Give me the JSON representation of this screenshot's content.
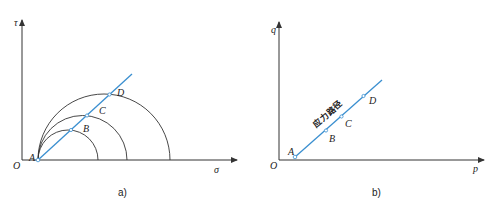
{
  "colors": {
    "axis": "#333333",
    "circle": "#333333",
    "stress_path": "#3a8fd0",
    "background": "#ffffff"
  },
  "panel_a": {
    "caption": "a)",
    "y_axis_label": "τ",
    "x_axis_label": "σ",
    "origin_label": "O",
    "points": [
      {
        "label": "A"
      },
      {
        "label": "B"
      },
      {
        "label": "C"
      },
      {
        "label": "D"
      }
    ]
  },
  "panel_b": {
    "caption": "b)",
    "y_axis_label": "q",
    "x_axis_label": "p",
    "origin_label": "O",
    "path_label": "应力路径",
    "points": [
      {
        "label": "A"
      },
      {
        "label": "B"
      },
      {
        "label": "C"
      },
      {
        "label": "D"
      }
    ]
  }
}
